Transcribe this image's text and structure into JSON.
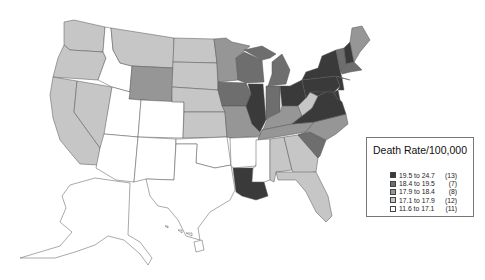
{
  "legend": {
    "title": "Death Rate/100,000",
    "items": [
      {
        "range": "19.5 to 24.7",
        "count": "(13)",
        "color": "#3a3a3a"
      },
      {
        "range": "18.4 to 19.5",
        "count": "(7)",
        "color": "#6e6e6e"
      },
      {
        "range": "17.9 to 18.4",
        "count": "(8)",
        "color": "#969696"
      },
      {
        "range": "17.1 to 17.9",
        "count": "(12)",
        "color": "#c6c6c6"
      },
      {
        "range": "11.6 to 17.1",
        "count": "(11)",
        "color": "#ffffff"
      }
    ]
  },
  "states": {
    "WA": "#c6c6c6",
    "OR": "#c6c6c6",
    "CA": "#c6c6c6",
    "NV": "#c6c6c6",
    "ID": "#ffffff",
    "MT": "#c6c6c6",
    "WY": "#969696",
    "UT": "#ffffff",
    "CO": "#ffffff",
    "AZ": "#ffffff",
    "NM": "#ffffff",
    "ND": "#c6c6c6",
    "SD": "#c6c6c6",
    "NE": "#c6c6c6",
    "KS": "#c6c6c6",
    "OK": "#ffffff",
    "TX": "#ffffff",
    "MN": "#969696",
    "IA": "#6e6e6e",
    "MO": "#969696",
    "AR": "#ffffff",
    "LA": "#3a3a3a",
    "WI": "#6e6e6e",
    "IL": "#3a3a3a",
    "MI": "#6e6e6e",
    "IN": "#6e6e6e",
    "OH": "#3a3a3a",
    "KY": "#969696",
    "TN": "#969696",
    "MS": "#ffffff",
    "AL": "#c6c6c6",
    "GA": "#c6c6c6",
    "FL": "#c6c6c6",
    "SC": "#6e6e6e",
    "NC": "#969696",
    "VA": "#3a3a3a",
    "WV": "#c6c6c6",
    "PA": "#3a3a3a",
    "NY": "#3a3a3a",
    "ME": "#969696",
    "VT": "#6e6e6e",
    "NH": "#3a3a3a",
    "MA": "#6e6e6e",
    "NJ": "#3a3a3a",
    "MD": "#3a3a3a",
    "DE": "#3a3a3a",
    "AK": "#ffffff",
    "HI": "#ffffff"
  }
}
